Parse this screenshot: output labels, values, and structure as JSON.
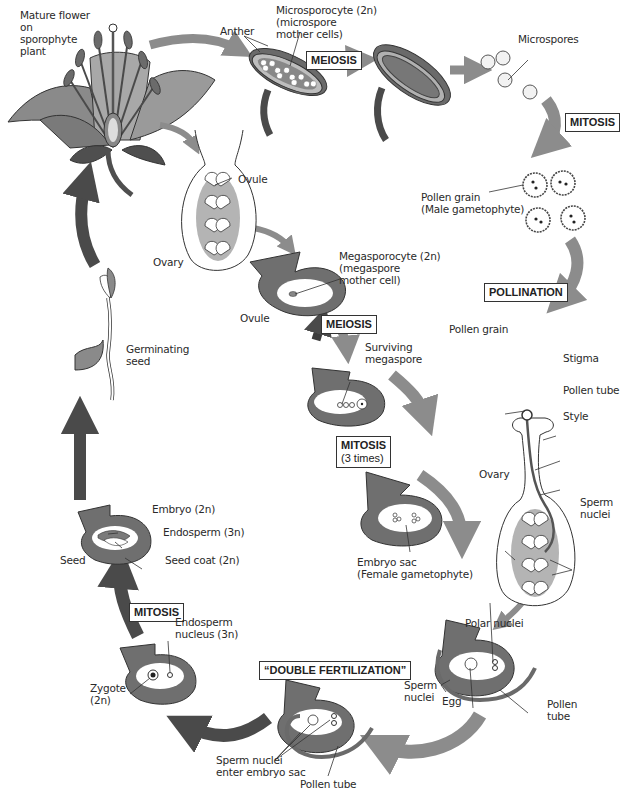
{
  "diagram": {
    "colors": {
      "dark_arrow": "#4a4a4a",
      "medium_arrow": "#8a8a8a",
      "tissue_gray": "#7d7d7d",
      "light_gray": "#b5b5b5",
      "outline": "#333333",
      "background": "#ffffff"
    },
    "labels": {
      "mature_flower": [
        "Mature flower",
        "on",
        "sporophyte",
        "plant"
      ],
      "anther": "Anther",
      "microsporocyte": [
        "Microsporocyte (2n)",
        "(microspore",
        "mother cells)"
      ],
      "microspores": "Microspores",
      "pollen_grain_male": [
        "Pollen grain",
        "(Male gametophyte)"
      ],
      "ovule_top": "Ovule",
      "ovary_left": "Ovary",
      "megasporocyte": [
        "Megasporocyte (2n)",
        "(megaspore",
        "mother cell)"
      ],
      "ovule_mid": "Ovule",
      "surviving_megaspore": [
        "Surviving",
        "megaspore"
      ],
      "embryo_sac": [
        "Embryo sac",
        "(Female gametophyte)"
      ],
      "pollen_grain": "Pollen grain",
      "stigma": "Stigma",
      "pollen_tube_style": "Pollen tube",
      "style": "Style",
      "ovary_right": "Ovary",
      "sperm_nuclei_right": [
        "Sperm",
        "nuclei"
      ],
      "germinating_seed": [
        "Germinating",
        "seed"
      ],
      "embryo": "Embryo (2n)",
      "endosperm": "Endosperm (3n)",
      "seed": "Seed",
      "seed_coat": "Seed coat (2n)",
      "endosperm_nucleus": [
        "Endosperm",
        "nucleus (3n)"
      ],
      "zygote": [
        "Zygote",
        "(2n)"
      ],
      "polar_nuclei": "Polar nuclei",
      "sperm_nuclei_bottom": [
        "Sperm",
        "nuclei"
      ],
      "egg": "Egg",
      "pollen_tube_right": [
        "Pollen",
        "tube"
      ],
      "sperm_nuclei_enter": [
        "Sperm nuclei",
        "enter embryo sac"
      ],
      "pollen_tube_bottom": "Pollen tube"
    },
    "process_boxes": {
      "meiosis_top": "MEIOSIS",
      "mitosis_top": "MITOSIS",
      "pollination": "POLLINATION",
      "meiosis_mid": "MEIOSIS",
      "mitosis_mid": "MITOSIS",
      "mitosis_mid_sub": "(3 times)",
      "mitosis_left": "MITOSIS",
      "double_fertilization": "“DOUBLE FERTILIZATION”"
    }
  }
}
